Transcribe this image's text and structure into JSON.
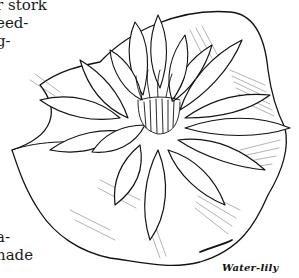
{
  "page": {
    "text_fragments_top": [
      "r stork",
      "eed-",
      "g-"
    ],
    "text_fragments_bottom": [
      "a-",
      "nade"
    ]
  },
  "illustration": {
    "subject": "water-lily flower on lily pad",
    "style": "black ink line drawing",
    "line_color": "#111111",
    "background_color": "#ffffff"
  },
  "caption": {
    "text": "Water-lily"
  }
}
